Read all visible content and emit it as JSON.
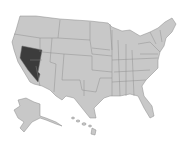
{
  "map": {
    "title": "United States",
    "highlighted_state": "Nevada",
    "colors": {
      "base": "#c8c8c8",
      "highlight": "#3c3c3c",
      "border": "#8a8a8a",
      "background": "#ffffff"
    }
  }
}
